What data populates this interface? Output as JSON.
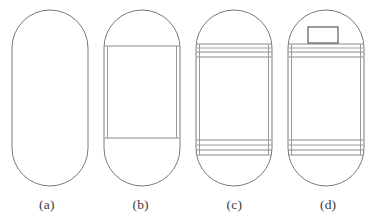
{
  "figure": {
    "background_color": "#ffffff",
    "stroke_color": "#7a7a7a",
    "stroke_color_dark": "#4a4a4a",
    "stroke_color_light": "#b5b5b5",
    "width": 375,
    "height": 222
  },
  "captions": [
    {
      "label": "(a)"
    },
    {
      "label": "(b)"
    },
    {
      "label": "(c)"
    },
    {
      "label": "(d)"
    }
  ],
  "panels": [
    {
      "id": "a",
      "caption": "(a)",
      "description": "plain capsule outline",
      "capsule": {
        "x": 12,
        "y": 10,
        "width": 76,
        "height": 176,
        "radius": 38
      },
      "features": []
    },
    {
      "id": "b",
      "caption": "(b)",
      "description": "capsule with cylindrical body section inset",
      "capsule": {
        "x": 104,
        "y": 10,
        "width": 76,
        "height": 176,
        "radius": 38
      },
      "features": [
        {
          "type": "horizontal-line",
          "y": 46
        },
        {
          "type": "horizontal-line",
          "y": 138
        },
        {
          "type": "vertical-line",
          "x": 107,
          "y1": 46,
          "y2": 138
        },
        {
          "type": "vertical-line",
          "x": 177,
          "y1": 46,
          "y2": 138
        }
      ]
    },
    {
      "id": "c",
      "caption": "(c)",
      "description": "capsule with banded reinforcement rings top and bottom",
      "capsule": {
        "x": 196,
        "y": 10,
        "width": 76,
        "height": 176,
        "radius": 38
      },
      "features": [
        {
          "type": "band-group",
          "position": "top",
          "lines": [
            44,
            48,
            52,
            57
          ]
        },
        {
          "type": "band-group",
          "position": "bottom",
          "lines": [
            140,
            145,
            150,
            155
          ]
        },
        {
          "type": "vertical-line",
          "x": 199,
          "y1": 44,
          "y2": 155
        },
        {
          "type": "vertical-line",
          "x": 269,
          "y1": 44,
          "y2": 155
        }
      ]
    },
    {
      "id": "d",
      "caption": "(d)",
      "description": "banded capsule with nozzle fitting on upper band",
      "capsule": {
        "x": 288,
        "y": 10,
        "width": 76,
        "height": 176,
        "radius": 38
      },
      "features": [
        {
          "type": "band-group",
          "position": "top",
          "lines": [
            44,
            48,
            52,
            57
          ]
        },
        {
          "type": "band-group",
          "position": "bottom",
          "lines": [
            140,
            145,
            150,
            155
          ]
        },
        {
          "type": "vertical-line",
          "x": 291,
          "y1": 44,
          "y2": 155
        },
        {
          "type": "vertical-line",
          "x": 361,
          "y1": 44,
          "y2": 155
        },
        {
          "type": "rectangle",
          "name": "nozzle-fitting",
          "x": 308,
          "y": 27,
          "width": 30,
          "height": 16
        }
      ]
    }
  ]
}
